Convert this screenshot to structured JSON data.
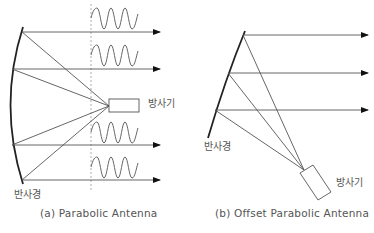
{
  "diagrams": [
    {
      "id": "a",
      "caption": "(a) Parabolic Antenna",
      "reflector_label": "반사경",
      "feed_label": "방사기"
    },
    {
      "id": "b",
      "caption": "(b) Offset Parabolic Antenna",
      "reflector_label": "반사경",
      "feed_label": "방사기"
    }
  ],
  "colors": {
    "line": "#555555",
    "reflector": "#222222",
    "dashed": "#999999",
    "text": "#555555"
  }
}
